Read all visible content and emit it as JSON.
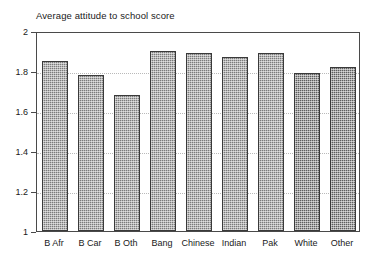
{
  "chart_data": {
    "type": "bar",
    "title": "Average attitude to school score",
    "xlabel": "",
    "ylabel": "",
    "categories": [
      "B Afr",
      "B Car",
      "B Oth",
      "Bang",
      "Chinese",
      "Indian",
      "Pak",
      "White",
      "Other"
    ],
    "values": [
      1.85,
      1.78,
      1.68,
      1.9,
      1.89,
      1.87,
      1.89,
      1.79,
      1.82
    ],
    "ylim": [
      1,
      2
    ],
    "yticks": [
      1,
      1.2,
      1.4,
      1.6,
      1.8,
      2
    ],
    "ytick_labels": [
      "1",
      "1.2",
      "1.4",
      "1.6",
      "1.8",
      "2"
    ],
    "grid": true,
    "grid_axis": "y",
    "legend": false,
    "legend_position": "none",
    "bar_color": "#7b7b7b",
    "bar_color_dark": "#5e5e5e",
    "bar_edge_color": "#3a3a3a",
    "axis_color": "#4a4a4a",
    "gridline_color": "#b9b9b9",
    "background": "#ffffff",
    "text_color": "#1a1a1a",
    "dark_bar_indices": [
      7,
      8
    ]
  },
  "axes": {
    "y_ticks": [
      {
        "label": "2",
        "value": 2
      },
      {
        "label": "1.8",
        "value": 1.8
      },
      {
        "label": "1.6",
        "value": 1.6
      },
      {
        "label": "1.4",
        "value": 1.4
      },
      {
        "label": "1.2",
        "value": 1.2
      },
      {
        "label": "1",
        "value": 1
      }
    ]
  }
}
